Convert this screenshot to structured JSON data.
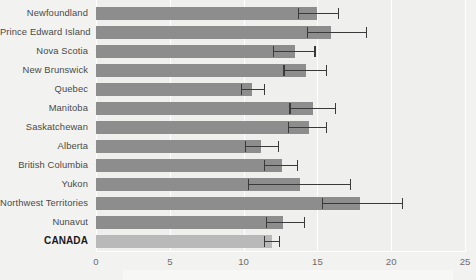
{
  "chart_data": {
    "type": "bar",
    "orientation": "horizontal",
    "title": "",
    "xlabel": "",
    "ylabel": "",
    "xlim": [
      0,
      25
    ],
    "xticks": [
      0,
      5,
      10,
      15,
      20,
      25
    ],
    "xtick_labels": [
      "0",
      "5",
      "10",
      "15",
      "20",
      "25"
    ],
    "grid": true,
    "legend": null,
    "categories": [
      "Newfoundland",
      "Prince Edward Island",
      "Nova Scotia",
      "New Brunswick",
      "Quebec",
      "Manitoba",
      "Saskatchewan",
      "Alberta",
      "British Columbia",
      "Yukon",
      "Northwest Territories",
      "Nunavut",
      "CANADA"
    ],
    "values": [
      15.0,
      15.9,
      13.5,
      14.2,
      10.6,
      14.7,
      14.4,
      11.2,
      12.6,
      13.8,
      17.9,
      12.7,
      11.9
    ],
    "error_low": [
      13.7,
      14.3,
      12.0,
      12.7,
      9.8,
      13.1,
      13.0,
      10.1,
      11.4,
      10.3,
      15.3,
      11.5,
      11.4
    ],
    "error_high": [
      16.4,
      18.3,
      14.8,
      15.6,
      11.4,
      16.2,
      15.6,
      12.3,
      13.6,
      17.2,
      20.7,
      14.1,
      12.4
    ],
    "bar_colors": [
      "#8d8d8d",
      "#8d8d8d",
      "#8d8d8d",
      "#8d8d8d",
      "#8d8d8d",
      "#8d8d8d",
      "#8d8d8d",
      "#8d8d8d",
      "#8d8d8d",
      "#8d8d8d",
      "#8d8d8d",
      "#8d8d8d",
      "#b9b9b9"
    ],
    "total_row_index": 12,
    "error_bar_color": "#3a3a3a",
    "background_color": "#f2f2f0",
    "plot_background_color": "#efefed",
    "gridline_color": "#ffffff"
  }
}
